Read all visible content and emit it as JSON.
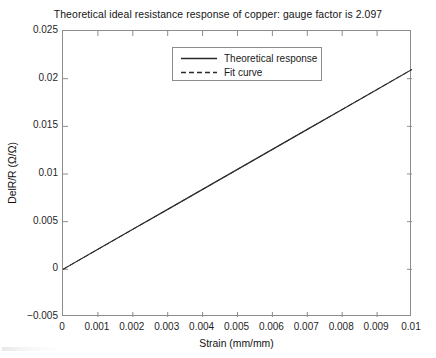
{
  "chart_data": {
    "type": "line",
    "title": "Theoretical ideal resistance response of copper: gauge factor is 2.097",
    "xlabel": "Strain (mm/mm)",
    "ylabel": "DelR/R (Ω/Ω)",
    "xlim": [
      0,
      0.01
    ],
    "ylim": [
      -0.005,
      0.025
    ],
    "xticks": [
      0,
      0.001,
      0.002,
      0.003,
      0.004,
      0.005,
      0.006,
      0.007,
      0.008,
      0.009,
      0.01
    ],
    "xtick_labels": [
      "0",
      "0.001",
      "0.002",
      "0.003",
      "0.004",
      "0.005",
      "0.006",
      "0.007",
      "0.008",
      "0.009",
      "0.01"
    ],
    "yticks": [
      -0.005,
      0,
      0.005,
      0.01,
      0.015,
      0.02,
      0.025
    ],
    "ytick_labels": [
      "-0.005",
      "0",
      "0.005",
      "0.01",
      "0.015",
      "0.02",
      "0.025"
    ],
    "grid": false,
    "gauge_factor": 2.097,
    "legend_position": "top-center",
    "series": [
      {
        "name": "Theoretical response",
        "style": "solid",
        "color": "#2b2b2b",
        "x": [
          0,
          0.001,
          0.002,
          0.003,
          0.004,
          0.005,
          0.006,
          0.007,
          0.008,
          0.009,
          0.01
        ],
        "values": [
          0,
          0.002097,
          0.004194,
          0.006291,
          0.008388,
          0.010485,
          0.012582,
          0.014679,
          0.016776,
          0.018873,
          0.02097
        ]
      },
      {
        "name": "Fit curve",
        "style": "dashed",
        "color": "#2b2b2b",
        "x": [
          0,
          0.001,
          0.002,
          0.003,
          0.004,
          0.005,
          0.006,
          0.007,
          0.008,
          0.009,
          0.01
        ],
        "values": [
          0,
          0.002097,
          0.004194,
          0.006291,
          0.008388,
          0.010485,
          0.012582,
          0.014679,
          0.016776,
          0.018873,
          0.02097
        ]
      }
    ]
  },
  "legend": {
    "entries": [
      {
        "label": "Theoretical response"
      },
      {
        "label": "Fit curve"
      }
    ]
  },
  "colors": {
    "axis": "#8c8c8c",
    "line": "#2b2b2b",
    "text": "#141414",
    "background": "#ffffff"
  }
}
